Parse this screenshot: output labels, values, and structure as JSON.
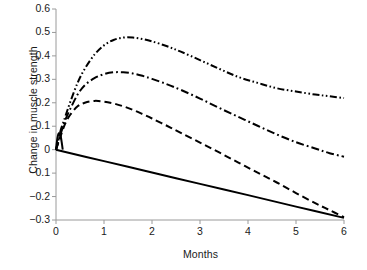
{
  "chart_data": {
    "type": "line",
    "title": "",
    "xlabel": "Months",
    "ylabel": "Change in muscle strength",
    "xlim": [
      0,
      6
    ],
    "ylim": [
      -0.3,
      0.6
    ],
    "xticks": [
      "0",
      "1",
      "2",
      "3",
      "4",
      "5",
      "6"
    ],
    "xtick_values": [
      0,
      1,
      2,
      3,
      4,
      5,
      6
    ],
    "yticks": [
      "0.6",
      "0.5",
      "0.4",
      "0.3",
      "0.2",
      "0.1",
      "0",
      "−0.1",
      "−0.2",
      "−0.3"
    ],
    "ytick_values": [
      0.6,
      0.5,
      0.4,
      0.3,
      0.2,
      0.1,
      0,
      -0.1,
      -0.2,
      -0.3
    ],
    "grid": false,
    "legend": "none",
    "axis_color": "#9a9a9a",
    "line_color": "#000000",
    "series": [
      {
        "name": "curve-dash-dot-dot",
        "style": "dash-dot-dot",
        "dasharray": "7,2.5,1.6,2.5,1.6,2.5",
        "width": 2.0,
        "x": [
          0,
          0.05,
          0.1,
          0.15,
          0.2,
          0.3,
          0.45,
          0.6,
          0.8,
          1.0,
          1.2,
          1.4,
          1.6,
          1.8,
          2.0,
          2.3,
          2.6,
          3.0,
          3.4,
          3.8,
          4.2,
          4.6,
          5.0,
          5.4,
          5.7,
          6.0
        ],
        "y": [
          0,
          0.04,
          0.085,
          0.115,
          0.145,
          0.205,
          0.285,
          0.345,
          0.405,
          0.445,
          0.468,
          0.478,
          0.478,
          0.472,
          0.462,
          0.442,
          0.418,
          0.382,
          0.345,
          0.31,
          0.285,
          0.262,
          0.248,
          0.235,
          0.228,
          0.22
        ]
      },
      {
        "name": "curve-dash-dot",
        "style": "dash-dot",
        "dasharray": "8,3,1.8,3",
        "width": 2.0,
        "x": [
          0,
          0.05,
          0.1,
          0.15,
          0.2,
          0.3,
          0.45,
          0.6,
          0.8,
          1.0,
          1.2,
          1.4,
          1.6,
          1.8,
          2.0,
          2.3,
          2.6,
          3.0,
          3.4,
          3.8,
          4.2,
          4.6,
          5.0,
          5.4,
          5.7,
          6.0
        ],
        "y": [
          0,
          0.035,
          0.07,
          0.1,
          0.13,
          0.175,
          0.235,
          0.275,
          0.305,
          0.322,
          0.33,
          0.33,
          0.325,
          0.315,
          0.302,
          0.28,
          0.255,
          0.218,
          0.178,
          0.14,
          0.102,
          0.065,
          0.032,
          0.005,
          -0.015,
          -0.03
        ]
      },
      {
        "name": "curve-dashed",
        "style": "dashed",
        "dasharray": "7,4",
        "width": 2.0,
        "x": [
          0,
          0.05,
          0.1,
          0.15,
          0.2,
          0.3,
          0.45,
          0.6,
          0.8,
          1.0,
          1.2,
          1.4,
          1.6,
          1.8,
          2.0,
          2.3,
          2.6,
          3.0,
          3.4,
          3.8,
          4.2,
          4.6,
          5.0,
          5.4,
          5.7,
          6.0
        ],
        "y": [
          0,
          0.03,
          0.06,
          0.09,
          0.115,
          0.15,
          0.185,
          0.2,
          0.208,
          0.205,
          0.197,
          0.185,
          0.17,
          0.152,
          0.133,
          0.103,
          0.072,
          0.03,
          -0.012,
          -0.055,
          -0.098,
          -0.14,
          -0.185,
          -0.228,
          -0.258,
          -0.288
        ]
      },
      {
        "name": "curve-solid-spike",
        "style": "solid",
        "dasharray": "none",
        "width": 2.0,
        "x": [
          0,
          0.02,
          0.04,
          0.06,
          0.08,
          0.1,
          0.12,
          0.14
        ],
        "y": [
          0,
          0.035,
          0.06,
          0.07,
          0.068,
          0.055,
          0.03,
          0.0
        ]
      },
      {
        "name": "curve-solid",
        "style": "solid",
        "dasharray": "none",
        "width": 2.0,
        "x": [
          0,
          1,
          2,
          3,
          4,
          5,
          6
        ],
        "y": [
          0,
          -0.049,
          -0.097,
          -0.146,
          -0.194,
          -0.243,
          -0.291
        ]
      }
    ]
  }
}
